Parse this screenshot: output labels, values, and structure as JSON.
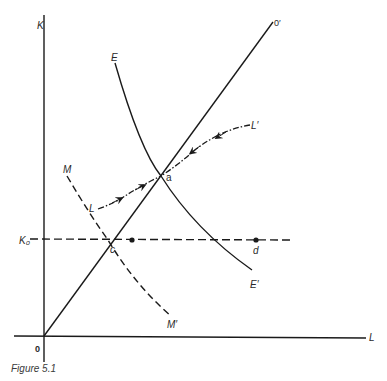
{
  "figure": {
    "caption": "Figure 5.1",
    "axes": {
      "y_label": "K",
      "x_label": "L",
      "origin_label": "0"
    },
    "curves": {
      "ray": {
        "start_label": "0",
        "end_label": "0′",
        "style": "solid"
      },
      "E": {
        "start_label": "E",
        "end_label": "E′",
        "style": "solid"
      },
      "M": {
        "start_label": "M",
        "end_label": "M′",
        "style": "dashed"
      },
      "L_path": {
        "start_label": "L",
        "end_label": "L′",
        "style": "dash-dot with arrows"
      },
      "K0_line": {
        "label": "K₀",
        "style": "dashed"
      }
    },
    "points": {
      "a": "a",
      "c": "c",
      "d": "d"
    },
    "colors": {
      "ink": "#1a1a1a",
      "background": "#ffffff"
    }
  }
}
